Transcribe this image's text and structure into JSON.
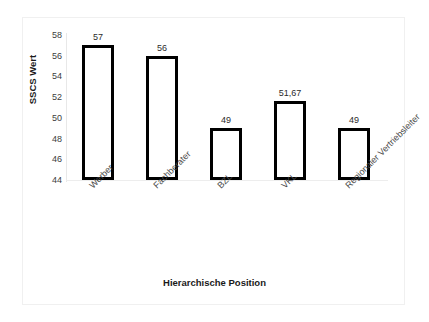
{
  "chart_data": {
    "type": "bar",
    "title": "",
    "subtitle": "",
    "xlabel": "Hierarchische Position",
    "ylabel": "SSCS Wert",
    "categories": [
      "Werber",
      "Fachberater",
      "BZL",
      "VKL",
      "Regionaler Vertriebsleiter"
    ],
    "values": [
      57,
      56,
      49,
      51.67,
      49
    ],
    "value_labels": [
      "57",
      "56",
      "49",
      "51,67",
      "49"
    ],
    "ylim": [
      44,
      58
    ],
    "yticks": [
      58,
      56,
      54,
      52,
      50,
      48,
      46,
      44
    ],
    "ytick_labels": [
      "58",
      "56",
      "54",
      "52",
      "50",
      "48",
      "46",
      "44"
    ],
    "grid": false,
    "legend": "none",
    "bar_fill_color": "#ffffff",
    "bar_edge_color": "#000000",
    "background_color": "#ffffff",
    "axis_line_color": "#e8e8e8",
    "tick_label_color": "#3d3d3d",
    "axis_title_color": "#1a1a1a",
    "category_label_rotation": -45
  }
}
